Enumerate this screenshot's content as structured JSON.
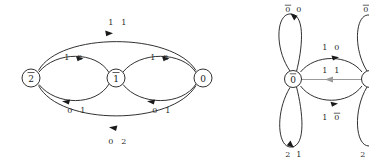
{
  "figure": {
    "background_color": "#ffffff",
    "width": 369,
    "height": 161,
    "edge_color": "#1a1a1a",
    "gray_edge_color": "#9a9a9a"
  },
  "left_graph": {
    "name": "left-transition-graph",
    "nodes": [
      {
        "id": "n2",
        "label": "2",
        "overline": true,
        "cx": 31,
        "cy": 78,
        "r": 9
      },
      {
        "id": "n1",
        "label": "1",
        "overline": true,
        "cx": 116,
        "cy": 78,
        "r": 9
      },
      {
        "id": "n0",
        "label": "0",
        "overline": false,
        "cx": 203,
        "cy": 78,
        "r": 9
      }
    ],
    "edges": [
      {
        "id": "e-2-0-top",
        "from": "n2",
        "to": "n0",
        "label_left": "1",
        "label_right": "1",
        "label_x": 117,
        "label_y": 22,
        "direction": "right"
      },
      {
        "id": "e-2-1-upper",
        "from": "n2",
        "to": "n1",
        "label_left": "1",
        "label_right": "2",
        "label_x": 73,
        "label_y": 57,
        "direction": "right"
      },
      {
        "id": "e-1-2-lower",
        "from": "n1",
        "to": "n2",
        "label_left": "0",
        "label_right": "1",
        "label_x": 76,
        "label_y": 110,
        "direction": "left"
      },
      {
        "id": "e-1-0-upper",
        "from": "n1",
        "to": "n0",
        "label_left": "1",
        "label_right": "2",
        "label_x": 159,
        "label_y": 57,
        "direction": "right"
      },
      {
        "id": "e-0-1-lower",
        "from": "n0",
        "to": "n1",
        "label_left": "0",
        "label_right": "1",
        "label_x": 161,
        "label_y": 110,
        "direction": "left"
      },
      {
        "id": "e-0-2-bottom",
        "from": "n0",
        "to": "n2",
        "label_left": "0",
        "label_right": "2",
        "label_x": 117,
        "label_y": 141,
        "direction": "left"
      }
    ]
  },
  "right_graph": {
    "name": "right-transition-graph",
    "nodes": [
      {
        "id": "r0",
        "label": "0",
        "overline": true,
        "cx": 293,
        "cy": 79,
        "r": 8.5
      },
      {
        "id": "r1",
        "label": "0",
        "overline": true,
        "cx": 370,
        "cy": 79,
        "r": 8.5,
        "clipped": true
      }
    ],
    "edges": [
      {
        "id": "r-loop-top",
        "type": "self-loop",
        "node": "r0",
        "label_left": "0",
        "label_left_overline": true,
        "label_right": "0",
        "label_right_overline": false,
        "label_x": 296,
        "label_y": 9,
        "direction": "down"
      },
      {
        "id": "r-loop-bottom",
        "type": "self-loop",
        "node": "r0",
        "label_left": "2",
        "label_left_overline": false,
        "label_right": "1",
        "label_right_overline": false,
        "label_x": 296,
        "label_y": 153,
        "direction": "down"
      },
      {
        "id": "r-arc-top",
        "type": "arc",
        "from": "r0",
        "to": "r1",
        "label_left": "1",
        "label_right": "0",
        "label_right_overline": false,
        "label_x": 331,
        "label_y": 50,
        "direction": "right"
      },
      {
        "id": "r-arc-bottom",
        "type": "arc",
        "from": "r0",
        "to": "r1",
        "label_left": "1",
        "label_right": "0",
        "label_right_overline": true,
        "label_x": 331,
        "label_y": 117,
        "direction": "right"
      },
      {
        "id": "r-straight",
        "type": "straight",
        "from": "r1",
        "to": "r0",
        "label_left": "1",
        "label_right": "1",
        "label_x": 331,
        "label_y": 72,
        "direction": "left",
        "color": "gray"
      }
    ],
    "clipped_node_labels": [
      {
        "id": "clip-top",
        "label": "0",
        "overline": true,
        "x": 366,
        "y": 9
      },
      {
        "id": "clip-bottom",
        "label": "2",
        "overline": false,
        "x": 363,
        "y": 153
      }
    ]
  }
}
